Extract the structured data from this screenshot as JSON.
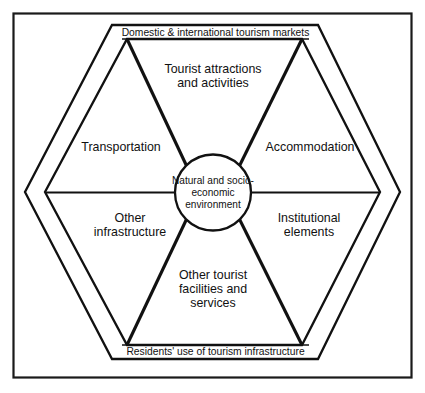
{
  "figure": {
    "type": "hexagonal-model-diagram",
    "title_text": "",
    "frame_color": "#1a1a1a",
    "line_color": "#111111",
    "background_color": "#ffffff",
    "center": {
      "name": "core-environment",
      "text": "Natural and socio-\neconomic\nenvironment"
    },
    "banners": {
      "top": "Domestic & international tourism markets",
      "bottom": "Residents' use of tourism infrastructure"
    },
    "sectors": [
      {
        "id": "tourist-attractions",
        "position": "top",
        "text": "Tourist attractions\nand activities"
      },
      {
        "id": "accommodation",
        "position": "upper-right",
        "text": "Accommodation"
      },
      {
        "id": "institutional-elements",
        "position": "lower-right",
        "text": "Institutional\nelements"
      },
      {
        "id": "other-tourist-facilities",
        "position": "bottom",
        "text": "Other tourist\nfacilities and\nservices"
      },
      {
        "id": "other-infrastructure",
        "position": "lower-left",
        "text": "Other\ninfrastructure"
      },
      {
        "id": "transportation",
        "position": "upper-left",
        "text": "Transportation"
      }
    ]
  }
}
